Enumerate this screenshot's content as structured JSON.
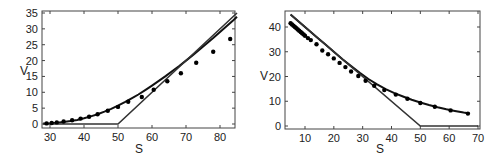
{
  "chart_data": [
    {
      "type": "line",
      "title": "",
      "xlabel": "S",
      "ylabel": "V",
      "xlim": [
        28,
        85
      ],
      "ylim": [
        -1,
        35
      ],
      "xticks": [
        30,
        40,
        50,
        60,
        70,
        80
      ],
      "yticks": [
        0,
        5,
        10,
        15,
        20,
        25,
        30,
        35
      ],
      "grid": false,
      "legend": null,
      "series": [
        {
          "name": "option value curve",
          "style": "line",
          "x": [
            28,
            30,
            32,
            34,
            36,
            38,
            40,
            42,
            44,
            46,
            48,
            50,
            52,
            54,
            56,
            58,
            60,
            62,
            64,
            66,
            68,
            70,
            72,
            74,
            76,
            78,
            80,
            82,
            84,
            85
          ],
          "y": [
            0.15,
            0.25,
            0.4,
            0.6,
            0.9,
            1.3,
            1.8,
            2.4,
            3.1,
            3.9,
            4.8,
            5.8,
            6.9,
            8.1,
            9.3,
            10.7,
            12.1,
            13.6,
            15.1,
            16.7,
            18.3,
            20.0,
            21.7,
            23.5,
            25.3,
            27.1,
            29.0,
            30.9,
            32.8,
            33.8
          ]
        },
        {
          "name": "payoff max(S-50,0)",
          "style": "line",
          "x": [
            28,
            50,
            85
          ],
          "y": [
            0,
            0,
            35
          ]
        },
        {
          "name": "data points",
          "style": "scatter",
          "x": [
            29,
            30.5,
            32,
            34,
            36.5,
            39,
            41.5,
            44,
            47,
            50,
            53,
            57,
            60.5,
            64.5,
            68.5,
            73,
            78,
            83
          ],
          "y": [
            0.2,
            0.3,
            0.5,
            0.8,
            1.2,
            1.7,
            2.3,
            3.1,
            4.2,
            5.4,
            7.0,
            8.5,
            10.8,
            13.5,
            16.0,
            19.3,
            22.8,
            26.8
          ]
        }
      ]
    },
    {
      "type": "line",
      "title": "",
      "xlabel": "S",
      "ylabel": "V",
      "xlim": [
        3,
        71
      ],
      "ylim": [
        -1,
        46
      ],
      "xticks": [
        10,
        20,
        30,
        40,
        50,
        60,
        70
      ],
      "yticks": [
        0,
        10,
        20,
        30,
        40
      ],
      "grid": false,
      "legend": null,
      "series": [
        {
          "name": "option value curve",
          "style": "line",
          "x": [
            5,
            8,
            11,
            14,
            17,
            20,
            23,
            26,
            29,
            32,
            35,
            38,
            41,
            44,
            47,
            50,
            53,
            56,
            59,
            62,
            65,
            67
          ],
          "y": [
            45,
            42,
            39,
            36,
            33,
            30,
            27,
            24.2,
            21.5,
            19.0,
            16.8,
            14.9,
            13.3,
            11.9,
            10.6,
            9.5,
            8.5,
            7.6,
            6.8,
            6.1,
            5.4,
            5.0
          ]
        },
        {
          "name": "payoff max(50-S,0)",
          "style": "line",
          "x": [
            5,
            50,
            70
          ],
          "y": [
            45,
            0,
            0
          ]
        },
        {
          "name": "data points",
          "style": "scatter",
          "x": [
            5,
            5.5,
            6,
            6.5,
            7,
            7.5,
            8,
            8.5,
            9,
            9.5,
            10,
            11,
            12,
            14,
            16,
            18,
            20,
            22,
            24,
            26,
            28.5,
            31,
            34,
            37.5,
            41.5,
            45.5,
            50,
            55,
            60.5,
            66.5
          ],
          "y": [
            41.5,
            41.0,
            40.5,
            40.0,
            39.5,
            39.0,
            38.5,
            38.0,
            37.5,
            37.0,
            36.5,
            35.5,
            34.7,
            33.0,
            30.5,
            29.0,
            27.3,
            25.5,
            23.8,
            22.0,
            20.2,
            18.3,
            16.3,
            14.5,
            12.7,
            11.0,
            9.3,
            7.8,
            6.3,
            5.0
          ]
        }
      ]
    }
  ],
  "charts": [
    {
      "xlabel": "S",
      "ylabel": "V",
      "xtick_labels": [
        "30",
        "40",
        "50",
        "60",
        "70",
        "80"
      ],
      "ytick_labels": [
        "0",
        "5",
        "10",
        "15",
        "20",
        "25",
        "30",
        "35"
      ]
    },
    {
      "xlabel": "S",
      "ylabel": "V",
      "xtick_labels": [
        "10",
        "20",
        "30",
        "40",
        "50",
        "60",
        "70"
      ],
      "ytick_labels": [
        "0",
        "10",
        "20",
        "30",
        "40"
      ]
    }
  ],
  "style": {
    "line_color": "#111111",
    "payoff_color": "#333333",
    "point_color": "#000000",
    "frame_color": "#444444"
  }
}
